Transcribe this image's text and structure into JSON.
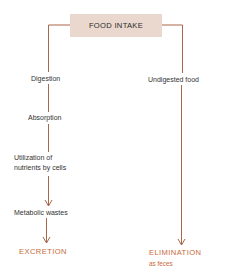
{
  "diagram": {
    "title": "FOOD INTAKE",
    "colors": {
      "line": "#a8664a",
      "box_fill": "#ead8ce",
      "outcome_text": "#c8693a",
      "label_text": "#333333"
    },
    "left_branch": {
      "steps": [
        "Digestion",
        "Absorption",
        "Utilization of",
        "nutrients by cells",
        "Metabolic wastes"
      ],
      "outcome": "EXCRETION"
    },
    "right_branch": {
      "steps": [
        "Undigested food"
      ],
      "outcome": "ELIMINATION",
      "outcome_note": "as feces"
    }
  }
}
